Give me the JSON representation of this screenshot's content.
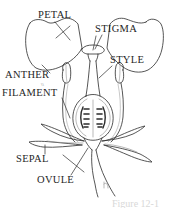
{
  "figure": {
    "type": "botanical-line-diagram",
    "background_color": "#ffffff",
    "line_color": "#2b2b2b",
    "shading_color": "#7a7a7a"
  },
  "labels": {
    "petal": "PETAL",
    "stigma": "STIGMA",
    "style": "STYLE",
    "anther": "ANTHER",
    "filament": "FILAMENT",
    "sepal": "SEPAL",
    "ovule": "OVULE",
    "anther_filament_tick": "\\\\"
  },
  "caption": {
    "text": "Figure 12-1"
  },
  "parts": [
    {
      "name": "petal-left",
      "label_ref": "petal"
    },
    {
      "name": "petal-right",
      "label_ref": "petal"
    },
    {
      "name": "stigma",
      "label_ref": "stigma"
    },
    {
      "name": "style",
      "label_ref": "style"
    },
    {
      "name": "ovary",
      "label_ref": "ovule"
    },
    {
      "name": "ovule-cluster-left",
      "label_ref": "ovule"
    },
    {
      "name": "ovule-cluster-right",
      "label_ref": "ovule"
    },
    {
      "name": "anther-left",
      "label_ref": "anther"
    },
    {
      "name": "anther-right",
      "label_ref": "anther"
    },
    {
      "name": "filament-left",
      "label_ref": "filament"
    },
    {
      "name": "filament-right",
      "label_ref": "filament"
    },
    {
      "name": "sepal-left",
      "label_ref": "sepal"
    },
    {
      "name": "sepal-right",
      "label_ref": "sepal"
    },
    {
      "name": "stem",
      "label_ref": null
    }
  ]
}
